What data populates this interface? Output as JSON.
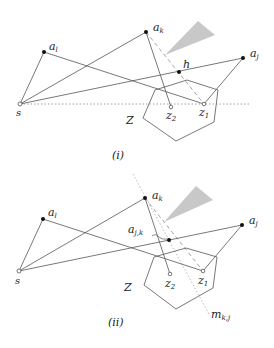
{
  "panels": [
    {
      "caption": "(i)",
      "labels": {
        "s": "s",
        "a_l": "a",
        "a_l_sub": "l",
        "a_k": "a",
        "a_k_sub": "k",
        "a_j": "a",
        "a_j_sub": "j",
        "h": "h",
        "Z": "Z",
        "z1": "z",
        "z1_sub": "1",
        "z2": "z",
        "z2_sub": "2"
      }
    },
    {
      "caption": "(ii)",
      "labels": {
        "s": "s",
        "a_l": "a",
        "a_l_sub": "l",
        "a_k": "a",
        "a_k_sub": "k",
        "a_j": "a",
        "a_j_sub": "j",
        "a_jk": "a",
        "a_jk_sub": "j,k",
        "Z": "Z",
        "z1": "z",
        "z1_sub": "1",
        "z2": "z",
        "z2_sub": "2",
        "m": "m",
        "m_sub": "k,j"
      }
    }
  ],
  "colors": {
    "line": "#555555",
    "cone": "#c8c8c8",
    "point": "#111111"
  }
}
